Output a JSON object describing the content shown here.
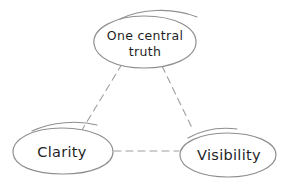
{
  "diagram": {
    "type": "concept-triangle-sketch",
    "colors": {
      "background": "#ffffff",
      "outline": "#8f8f8f",
      "dash": "#9e9e9e",
      "text": "#1f1f1f"
    },
    "nodes": {
      "top": {
        "label": "One central truth",
        "lines": [
          "One central",
          "truth"
        ]
      },
      "left": {
        "label": "Clarity"
      },
      "right": {
        "label": "Visibility"
      }
    },
    "edges": [
      {
        "from": "One central truth",
        "to": "Clarity",
        "style": "dashed"
      },
      {
        "from": "One central truth",
        "to": "Visibility",
        "style": "dashed"
      },
      {
        "from": "Clarity",
        "to": "Visibility",
        "style": "dashed"
      }
    ]
  }
}
